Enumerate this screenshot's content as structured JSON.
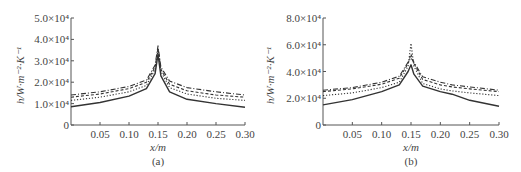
{
  "chart_data": [
    {
      "type": "line",
      "panel_label": "(a)",
      "title": "",
      "xlabel": "x/m",
      "ylabel": "h/W·m⁻²·K⁻¹",
      "xlim": [
        0,
        0.3
      ],
      "ylim": [
        0,
        50000
      ],
      "x_ticks": [
        "0.05",
        "0.10",
        "0.15",
        "0.20",
        "0.25",
        "0.30"
      ],
      "y_ticks": [
        "0",
        "1.0×10⁴",
        "2.0×10⁴",
        "3.0×10⁴",
        "4.0×10⁴",
        "5.0×10⁴"
      ],
      "grid": false,
      "legend": "none",
      "x": [
        0.0,
        0.05,
        0.1,
        0.13,
        0.145,
        0.15,
        0.155,
        0.17,
        0.2,
        0.25,
        0.3
      ],
      "series": [
        {
          "name": "solid",
          "style": "solid",
          "values": [
            8500,
            10500,
            13500,
            17000,
            24000,
            33000,
            23000,
            15500,
            12000,
            10000,
            8300
          ]
        },
        {
          "name": "dotted",
          "style": "dotted",
          "values": [
            11500,
            13000,
            15500,
            18500,
            26000,
            35000,
            25000,
            17500,
            14500,
            12500,
            11500
          ]
        },
        {
          "name": "dashed",
          "style": "dashed",
          "values": [
            13000,
            14500,
            17000,
            20000,
            27000,
            36000,
            26000,
            19000,
            16000,
            14000,
            13000
          ]
        },
        {
          "name": "dash-dot",
          "style": "dashdot",
          "values": [
            14000,
            15500,
            18000,
            21000,
            28000,
            37000,
            27000,
            20500,
            17500,
            15500,
            14000
          ]
        }
      ]
    },
    {
      "type": "line",
      "panel_label": "(b)",
      "title": "",
      "xlabel": "x/m",
      "ylabel": "h/W·m⁻²·K⁻¹",
      "xlim": [
        0,
        0.3
      ],
      "ylim": [
        0,
        80000
      ],
      "x_ticks": [
        "0.05",
        "0.10",
        "0.15",
        "0.20",
        "0.25",
        "0.30"
      ],
      "y_ticks": [
        "0",
        "2.0×10⁴",
        "4.0×10⁴",
        "6.0×10⁴",
        "8.0×10⁴"
      ],
      "grid": false,
      "legend": "none",
      "x": [
        0.0,
        0.05,
        0.1,
        0.13,
        0.145,
        0.15,
        0.155,
        0.17,
        0.2,
        0.22,
        0.25,
        0.3
      ],
      "series": [
        {
          "name": "solid",
          "style": "solid",
          "values": [
            15000,
            19000,
            25000,
            30000,
            40000,
            45000,
            38000,
            29000,
            25000,
            23000,
            18500,
            14000
          ]
        },
        {
          "name": "dotted",
          "style": "dotted",
          "values": [
            22000,
            24000,
            28000,
            32000,
            44000,
            61000,
            44000,
            31000,
            27000,
            25500,
            24000,
            22000
          ]
        },
        {
          "name": "dashed",
          "style": "dashed",
          "values": [
            25000,
            27000,
            30500,
            35000,
            46000,
            53000,
            46000,
            34000,
            30000,
            28500,
            27000,
            25000
          ]
        },
        {
          "name": "dash-dot",
          "style": "dashdot",
          "values": [
            26000,
            28000,
            32000,
            36500,
            47000,
            50000,
            47000,
            36000,
            32000,
            30000,
            28500,
            26000
          ]
        }
      ]
    }
  ],
  "panels": [
    {
      "id": "a",
      "caption": "(a)",
      "xlabel": "x/m"
    },
    {
      "id": "b",
      "caption": "(b)",
      "xlabel": "x/m"
    }
  ]
}
